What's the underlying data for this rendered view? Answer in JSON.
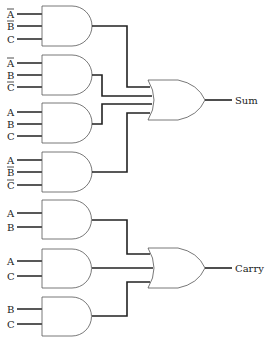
{
  "outputs": {
    "sum": "Sum",
    "carry": "Carry"
  },
  "gates": [
    {
      "type": "AND",
      "inputs": [
        {
          "label": "A",
          "inverted": true
        },
        {
          "label": "B",
          "inverted": true
        },
        {
          "label": "C",
          "inverted": false
        }
      ]
    },
    {
      "type": "AND",
      "inputs": [
        {
          "label": "A",
          "inverted": true
        },
        {
          "label": "B",
          "inverted": false
        },
        {
          "label": "C",
          "inverted": true
        }
      ]
    },
    {
      "type": "AND",
      "inputs": [
        {
          "label": "A",
          "inverted": false
        },
        {
          "label": "B",
          "inverted": false
        },
        {
          "label": "C",
          "inverted": false
        }
      ]
    },
    {
      "type": "AND",
      "inputs": [
        {
          "label": "A",
          "inverted": false
        },
        {
          "label": "B",
          "inverted": true
        },
        {
          "label": "C",
          "inverted": true
        }
      ]
    },
    {
      "type": "AND",
      "inputs": [
        {
          "label": "A",
          "inverted": false
        },
        {
          "label": "B",
          "inverted": false
        }
      ]
    },
    {
      "type": "AND",
      "inputs": [
        {
          "label": "A",
          "inverted": false
        },
        {
          "label": "C",
          "inverted": false
        }
      ]
    },
    {
      "type": "AND",
      "inputs": [
        {
          "label": "B",
          "inverted": false
        },
        {
          "label": "C",
          "inverted": false
        }
      ]
    },
    {
      "type": "OR",
      "feeds": "Sum",
      "from": [
        0,
        1,
        2,
        3
      ]
    },
    {
      "type": "OR",
      "feeds": "Carry",
      "from": [
        4,
        5,
        6
      ]
    }
  ],
  "labels": {
    "g1": [
      "A",
      "B",
      "C"
    ],
    "g2": [
      "A",
      "B",
      "C"
    ],
    "g3": [
      "A",
      "B",
      "C"
    ],
    "g4": [
      "A",
      "B",
      "C"
    ],
    "g5": [
      "A",
      "B"
    ],
    "g6": [
      "A",
      "C"
    ],
    "g7": [
      "B",
      "C"
    ]
  }
}
